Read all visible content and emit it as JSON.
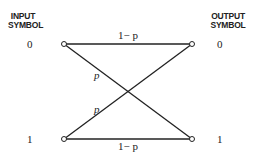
{
  "input_header": [
    "INPUT",
    "SYMBOL"
  ],
  "output_header": [
    "OUTPUT",
    "SYMBOL"
  ],
  "input_symbols": [
    "0",
    "1"
  ],
  "output_symbols": [
    "0",
    "1"
  ],
  "edges": [
    {
      "from": "0",
      "to": "0",
      "label": "1− p"
    },
    {
      "from": "0",
      "to": "1",
      "label": "p"
    },
    {
      "from": "1",
      "to": "0",
      "label": "p"
    },
    {
      "from": "1",
      "to": "1",
      "label": "1− p"
    }
  ]
}
